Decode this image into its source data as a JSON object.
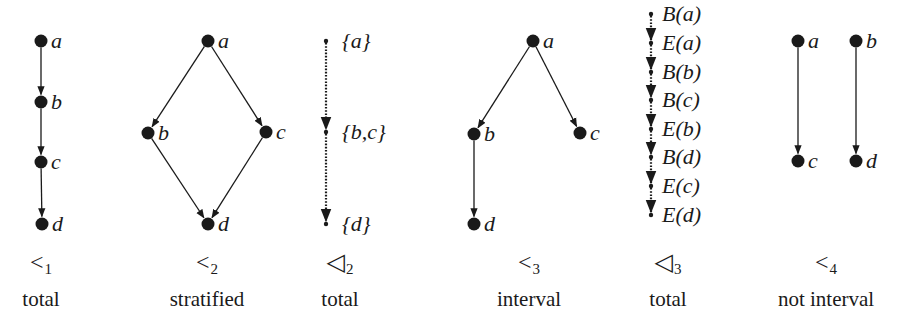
{
  "figure": {
    "panels": [
      {
        "id": "p1",
        "symbol": "<",
        "subscript": "1",
        "caption": "total",
        "style": "solid",
        "nodes": [
          {
            "id": "a",
            "label": "a",
            "x": 41,
            "y": 41
          },
          {
            "id": "b",
            "label": "b",
            "x": 41,
            "y": 102
          },
          {
            "id": "c",
            "label": "c",
            "x": 41,
            "y": 162
          },
          {
            "id": "d",
            "label": "d",
            "x": 42,
            "y": 224
          }
        ],
        "edges": [
          [
            "a",
            "b"
          ],
          [
            "b",
            "c"
          ],
          [
            "c",
            "d"
          ]
        ],
        "caption_x": 41
      },
      {
        "id": "p2",
        "symbol": "<",
        "subscript": "2",
        "caption": "stratified",
        "style": "solid",
        "nodes": [
          {
            "id": "a",
            "label": "a",
            "x": 208,
            "y": 41
          },
          {
            "id": "b",
            "label": "b",
            "x": 148,
            "y": 133
          },
          {
            "id": "c",
            "label": "c",
            "x": 266,
            "y": 132
          },
          {
            "id": "d",
            "label": "d",
            "x": 208,
            "y": 224
          }
        ],
        "edges": [
          [
            "a",
            "b"
          ],
          [
            "a",
            "c"
          ],
          [
            "b",
            "d"
          ],
          [
            "c",
            "d"
          ]
        ],
        "caption_x": 207
      },
      {
        "id": "p3",
        "symbol": "◁",
        "subscript": "2",
        "caption": "total",
        "style": "dotted",
        "nodes": [
          {
            "id": "a",
            "label": "{a}",
            "x": 326,
            "y": 41
          },
          {
            "id": "bc",
            "label": "{b,c}",
            "x": 326,
            "y": 132
          },
          {
            "id": "d",
            "label": "{d}",
            "x": 326,
            "y": 224
          }
        ],
        "edges": [
          [
            "a",
            "bc"
          ],
          [
            "bc",
            "d"
          ]
        ],
        "caption_x": 340
      },
      {
        "id": "p4",
        "symbol": "<",
        "subscript": "3",
        "caption": "interval",
        "style": "solid",
        "nodes": [
          {
            "id": "a",
            "label": "a",
            "x": 533,
            "y": 41
          },
          {
            "id": "b",
            "label": "b",
            "x": 474,
            "y": 134
          },
          {
            "id": "c",
            "label": "c",
            "x": 580,
            "y": 133
          },
          {
            "id": "d",
            "label": "d",
            "x": 474,
            "y": 224
          }
        ],
        "edges": [
          [
            "a",
            "b"
          ],
          [
            "a",
            "c"
          ],
          [
            "b",
            "d"
          ]
        ],
        "caption_x": 529
      },
      {
        "id": "p5",
        "symbol": "◁",
        "subscript": "3",
        "caption": "total",
        "style": "dotted",
        "nodes": [
          {
            "id": "Ba",
            "label": "B(a)",
            "x": 651,
            "y": 14
          },
          {
            "id": "Ea",
            "label": "E(a)",
            "x": 651,
            "y": 43
          },
          {
            "id": "Bb",
            "label": "B(b)",
            "x": 651,
            "y": 72
          },
          {
            "id": "Bc",
            "label": "B(c)",
            "x": 651,
            "y": 100
          },
          {
            "id": "Eb",
            "label": "E(b)",
            "x": 651,
            "y": 129
          },
          {
            "id": "Bd",
            "label": "B(d)",
            "x": 651,
            "y": 157
          },
          {
            "id": "Ec",
            "label": "E(c)",
            "x": 651,
            "y": 186
          },
          {
            "id": "Ed",
            "label": "E(d)",
            "x": 651,
            "y": 215
          }
        ],
        "edges": [
          [
            "Ba",
            "Ea"
          ],
          [
            "Ea",
            "Bb"
          ],
          [
            "Bb",
            "Bc"
          ],
          [
            "Bc",
            "Eb"
          ],
          [
            "Eb",
            "Bd"
          ],
          [
            "Bd",
            "Ec"
          ],
          [
            "Ec",
            "Ed"
          ]
        ],
        "caption_x": 668
      },
      {
        "id": "p6",
        "symbol": "<",
        "subscript": "4",
        "caption": "not interval",
        "style": "solid",
        "nodes": [
          {
            "id": "a",
            "label": "a",
            "x": 798,
            "y": 41
          },
          {
            "id": "b",
            "label": "b",
            "x": 856,
            "y": 41
          },
          {
            "id": "c",
            "label": "c",
            "x": 798,
            "y": 161
          },
          {
            "id": "d",
            "label": "d",
            "x": 856,
            "y": 161
          }
        ],
        "edges": [
          [
            "a",
            "c"
          ],
          [
            "b",
            "d"
          ]
        ],
        "caption_x": 826
      }
    ],
    "colors": {
      "ink": "#1a1a1a",
      "background": "#ffffff"
    }
  }
}
